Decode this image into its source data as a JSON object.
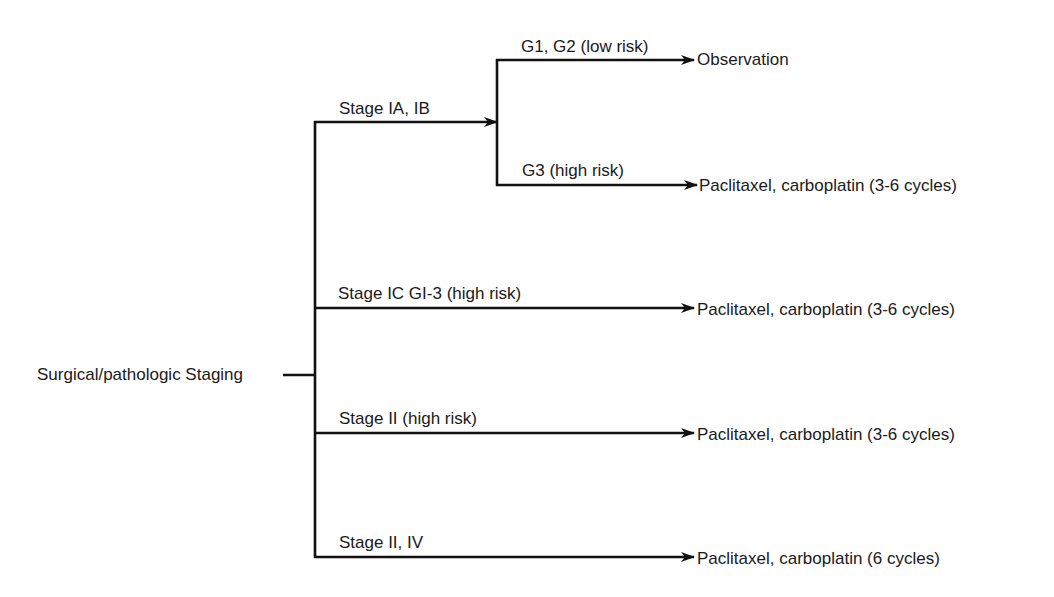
{
  "diagram": {
    "type": "treatment-decision-tree",
    "root": {
      "label": "Surgical/pathologic Staging"
    },
    "branches": [
      {
        "label": "Stage IA, IB",
        "children": [
          {
            "label": "G1, G2 (low risk)",
            "outcome": "Observation"
          },
          {
            "label": "G3 (high risk)",
            "outcome": "Paclitaxel, carboplatin (3-6 cycles)"
          }
        ]
      },
      {
        "label": "Stage IC GI-3 (high risk)",
        "outcome": "Paclitaxel, carboplatin (3-6 cycles)"
      },
      {
        "label": "Stage II (high risk)",
        "outcome": "Paclitaxel, carboplatin (3-6 cycles)"
      },
      {
        "label": "Stage II, IV",
        "outcome": "Paclitaxel, carboplatin (6 cycles)"
      }
    ]
  },
  "colors": {
    "line": "#111111",
    "text": "#1a1a1a",
    "background": "#ffffff"
  }
}
